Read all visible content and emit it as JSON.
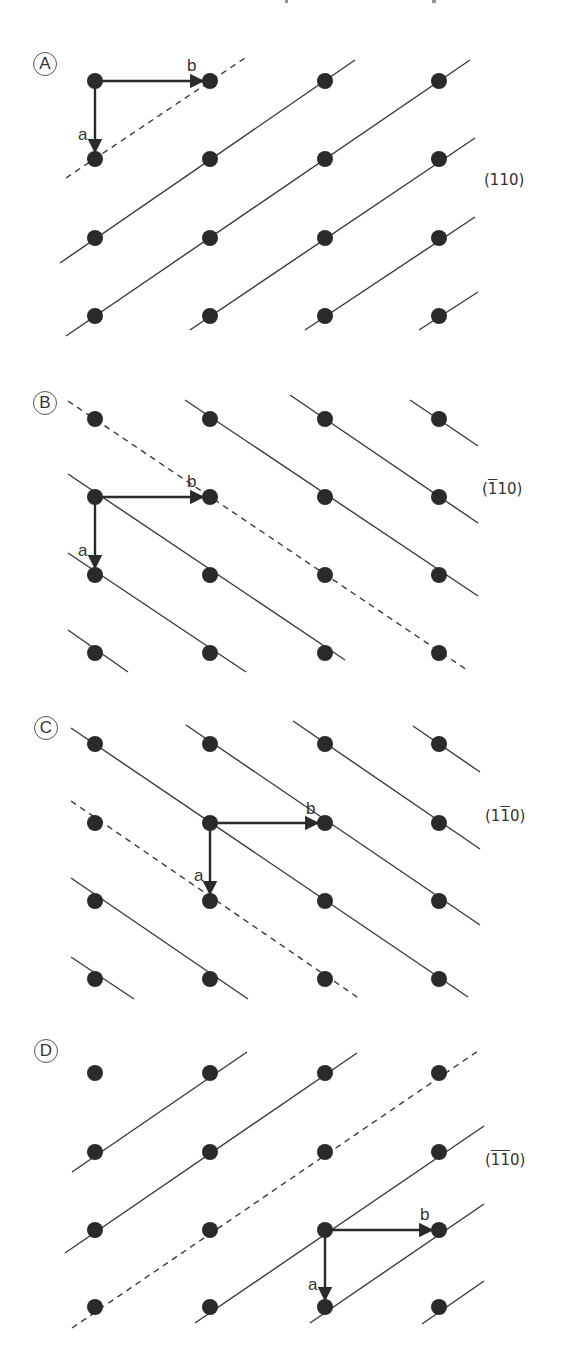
{
  "figure": {
    "columns_x": [
      95,
      210,
      325,
      439
    ],
    "dot_radius": 8,
    "dot_color": "#2a2a2a",
    "line_color": "#3a3a3a",
    "panels": [
      {
        "id": "A",
        "label": "A",
        "label_pos": [
          33,
          52
        ],
        "plane": {
          "prefix": "(",
          "bar": "",
          "rest": "110)",
          "pos": [
            484,
            171
          ]
        },
        "rows_y": [
          81,
          159,
          238,
          316
        ],
        "origin": [
          95,
          81
        ],
        "vec_a": {
          "label": "a",
          "to": [
            95,
            159
          ],
          "label_pos": [
            78,
            125
          ]
        },
        "vec_b": {
          "label": "b",
          "to": [
            210,
            81
          ],
          "label_pos": [
            187,
            56
          ]
        },
        "dashed": [
          [
            [
              66,
              178
            ],
            [
              245,
              58
            ]
          ]
        ],
        "solid": [
          [
            [
              60,
              263
            ],
            [
              355,
              60
            ]
          ],
          [
            [
              66,
              336
            ],
            [
              470,
              60
            ]
          ],
          [
            [
              190,
              330
            ],
            [
              475,
              138
            ]
          ],
          [
            [
              305,
              330
            ],
            [
              475,
              217
            ]
          ],
          [
            [
              419,
              330
            ],
            [
              478,
              292
            ]
          ]
        ],
        "isolated": []
      },
      {
        "id": "B",
        "label": "B",
        "label_pos": [
          33,
          391
        ],
        "plane": {
          "prefix": "(",
          "bar": "1",
          "rest": "10)",
          "pos": [
            482,
            480
          ]
        },
        "rows_y": [
          419,
          497,
          575,
          653
        ],
        "origin": [
          95,
          497
        ],
        "vec_a": {
          "label": "a",
          "to": [
            95,
            575
          ],
          "label_pos": [
            78,
            541
          ]
        },
        "vec_b": {
          "label": "b",
          "to": [
            210,
            497
          ],
          "label_pos": [
            187,
            472
          ]
        },
        "dashed": [
          [
            [
              68,
              401
            ],
            [
              467,
              670
            ]
          ]
        ],
        "solid": [
          [
            [
              185,
              400
            ],
            [
              478,
              596
            ]
          ],
          [
            [
              290,
              395
            ],
            [
              478,
              523
            ]
          ],
          [
            [
              410,
              400
            ],
            [
              478,
              446
            ]
          ],
          [
            [
              68,
              474
            ],
            [
              345,
              660
            ]
          ],
          [
            [
              68,
              553
            ],
            [
              246,
              672
            ]
          ],
          [
            [
              68,
              630
            ],
            [
              128,
              672
            ]
          ]
        ],
        "isolated": []
      },
      {
        "id": "C",
        "label": "C",
        "label_pos": [
          34,
          716
        ],
        "plane": {
          "prefix": "(1",
          "bar": "1",
          "rest": "0)",
          "pos": [
            485,
            807
          ]
        },
        "rows_y": [
          744,
          823,
          901,
          979
        ],
        "origin": [
          210,
          823
        ],
        "vec_a": {
          "label": "a",
          "to": [
            210,
            901
          ],
          "label_pos": [
            194,
            866
          ]
        },
        "vec_b": {
          "label": "b",
          "to": [
            325,
            823
          ],
          "label_pos": [
            306,
            799
          ]
        },
        "dashed": [
          [
            [
              71,
              801
            ],
            [
              360,
              999
            ]
          ]
        ],
        "solid": [
          [
            [
              71,
              728
            ],
            [
              468,
              997
            ]
          ],
          [
            [
              186,
              725
            ],
            [
              480,
              925
            ]
          ],
          [
            [
              293,
              721
            ],
            [
              480,
              849
            ]
          ],
          [
            [
              413,
              726
            ],
            [
              480,
              772
            ]
          ],
          [
            [
              71,
              878
            ],
            [
              248,
              999
            ]
          ],
          [
            [
              71,
              957
            ],
            [
              134,
              999
            ]
          ]
        ],
        "isolated": []
      },
      {
        "id": "D",
        "label": "D",
        "label_pos": [
          34,
          1039
        ],
        "plane": {
          "prefix": "(",
          "bar": "11",
          "rest": "0)",
          "pos": [
            485,
            1151
          ]
        },
        "rows_y": [
          1073,
          1152,
          1230,
          1307
        ],
        "origin": [
          325,
          1230
        ],
        "vec_a": {
          "label": "a",
          "to": [
            325,
            1307
          ],
          "label_pos": [
            308,
            1275
          ]
        },
        "vec_b": {
          "label": "b",
          "to": [
            439,
            1230
          ],
          "label_pos": [
            420,
            1205
          ]
        },
        "dashed": [
          [
            [
              72,
              1328
            ],
            [
              478,
              1051
            ]
          ]
        ],
        "solid": [
          [
            [
              72,
              1172
            ],
            [
              247,
              1052
            ]
          ],
          [
            [
              65,
              1253
            ],
            [
              357,
              1053
            ]
          ],
          [
            [
              195,
              1323
            ],
            [
              484,
              1126
            ]
          ],
          [
            [
              310,
              1323
            ],
            [
              484,
              1204
            ]
          ],
          [
            [
              422,
              1324
            ],
            [
              484,
              1281
            ]
          ]
        ],
        "isolated": [
          [
            95,
            1073
          ]
        ]
      }
    ]
  }
}
